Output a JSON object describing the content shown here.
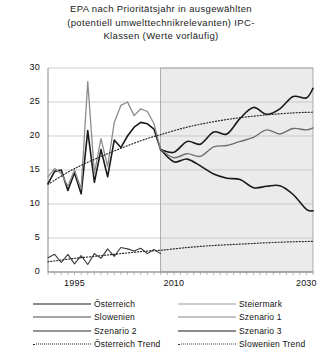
{
  "chart_data": {
    "type": "line",
    "title_lines": [
      "EPA nach Prioritätsjahr in ausgewählten",
      "(potentiell umwelttechnikrelevanten) IPC-",
      "Klassen (Werte vorläufig)"
    ],
    "xlabel": "",
    "ylabel": "",
    "xlim": [
      1991,
      2031
    ],
    "ylim": [
      0,
      30
    ],
    "yticks": [
      0,
      5,
      10,
      15,
      20,
      25,
      30
    ],
    "xticks": [
      1995,
      2010,
      2030
    ],
    "grid": true,
    "legend_position": "below",
    "forecast_region": {
      "start": 2008,
      "end": 2031,
      "shaded": true,
      "fill": "#ebebeb"
    },
    "series": [
      {
        "name": "Österreich",
        "style": "solid",
        "color": "#1a1a1a",
        "width": 1.6,
        "x": [
          1991,
          1992,
          1993,
          1994,
          1995,
          1996,
          1997,
          1998,
          1999,
          2000,
          2001,
          2002,
          2003,
          2004,
          2005,
          2006,
          2007,
          2008
        ],
        "values": [
          13.0,
          14.8,
          15.0,
          12.0,
          14.6,
          11.5,
          20.8,
          13.2,
          18.0,
          14.0,
          19.4,
          18.3,
          20.0,
          21.3,
          22.0,
          21.8,
          21.0,
          18.0
        ]
      },
      {
        "name": "Steiermark",
        "style": "solid",
        "color": "#8c8c8c",
        "width": 1.3,
        "x": [
          1991,
          1992,
          1993,
          1994,
          1995,
          1996,
          1997,
          1998,
          1999,
          2000,
          2001,
          2002,
          2003,
          2004,
          2005,
          2006,
          2007,
          2008
        ],
        "values": [
          14.0,
          15.2,
          14.5,
          12.6,
          15.0,
          12.2,
          28.0,
          14.5,
          19.6,
          15.5,
          22.0,
          24.5,
          25.0,
          23.0,
          24.0,
          23.6,
          21.8,
          18.0
        ]
      },
      {
        "name": "Slowenien",
        "style": "solid",
        "color": "#3a3a3a",
        "width": 1.1,
        "x": [
          1991,
          1992,
          1993,
          1994,
          1995,
          1996,
          1997,
          1998,
          1999,
          2000,
          2001,
          2002,
          2003,
          2004,
          2005,
          2006,
          2007,
          2008
        ],
        "values": [
          2.1,
          2.6,
          1.4,
          2.6,
          1.2,
          2.4,
          1.1,
          2.7,
          2.0,
          3.4,
          2.3,
          3.6,
          3.4,
          3.1,
          3.5,
          2.7,
          3.3,
          2.7
        ]
      },
      {
        "name": "Szenario 1",
        "style": "solid",
        "color": "#1a1a1a",
        "width": 1.6,
        "x": [
          2008,
          2010,
          2012,
          2014,
          2016,
          2018,
          2020,
          2022,
          2024,
          2026,
          2028,
          2030,
          2031
        ],
        "values": [
          18.0,
          17.6,
          19.2,
          18.8,
          20.6,
          20.3,
          22.6,
          24.2,
          23.2,
          24.0,
          25.8,
          25.6,
          27.0
        ]
      },
      {
        "name": "Szenario 2",
        "style": "solid",
        "color": "#1a1a1a",
        "width": 1.6,
        "x": [
          2008,
          2010,
          2012,
          2014,
          2016,
          2018,
          2020,
          2022,
          2024,
          2026,
          2028,
          2030,
          2031
        ],
        "values": [
          18.0,
          16.2,
          16.6,
          15.6,
          14.4,
          13.8,
          13.6,
          12.4,
          12.6,
          12.7,
          11.4,
          9.2,
          9.0
        ]
      },
      {
        "name": "Szenario 3",
        "style": "solid",
        "color": "#6e6e6e",
        "width": 1.4,
        "x": [
          2008,
          2010,
          2012,
          2014,
          2016,
          2018,
          2020,
          2022,
          2024,
          2026,
          2028,
          2030,
          2031
        ],
        "values": [
          18.0,
          16.8,
          17.4,
          17.0,
          18.4,
          18.6,
          19.2,
          19.8,
          20.9,
          20.3,
          21.1,
          20.9,
          21.2
        ]
      },
      {
        "name": "Österreich Trend",
        "style": "dotted",
        "color": "#2b2b2b",
        "width": 1.2,
        "x": [
          1991,
          1995,
          2000,
          2005,
          2008,
          2012,
          2016,
          2020,
          2024,
          2028,
          2031
        ],
        "values": [
          12.9,
          15.2,
          17.4,
          19.3,
          20.2,
          21.3,
          22.1,
          22.7,
          23.1,
          23.4,
          23.5
        ]
      },
      {
        "name": "Slowenien Trend",
        "style": "dotted",
        "color": "#2b2b2b",
        "width": 1.2,
        "x": [
          1991,
          1995,
          2000,
          2005,
          2008,
          2012,
          2016,
          2020,
          2024,
          2028,
          2031
        ],
        "values": [
          1.5,
          2.0,
          2.5,
          3.0,
          3.2,
          3.6,
          3.9,
          4.1,
          4.3,
          4.45,
          4.5
        ]
      }
    ],
    "legend": [
      {
        "label": "Österreich",
        "style": "solid",
        "color": "#1a1a1a",
        "width": 1.8,
        "column": "left"
      },
      {
        "label": "Steiermark",
        "style": "solid",
        "color": "#9a9a9a",
        "width": 1.2,
        "column": "right"
      },
      {
        "label": "Slowenien",
        "style": "solid",
        "color": "#4a4a4a",
        "width": 1.1,
        "column": "left"
      },
      {
        "label": "Szenario 1",
        "style": "solid",
        "color": "#8a8a8a",
        "width": 1.1,
        "column": "right"
      },
      {
        "label": "Szenario 2",
        "style": "solid",
        "color": "#2b2b2b",
        "width": 1.6,
        "column": "left"
      },
      {
        "label": "Szenario 3",
        "style": "solid",
        "color": "#1a1a1a",
        "width": 1.8,
        "column": "right"
      },
      {
        "label": "Österreich Trend",
        "style": "dotted",
        "color": "#1a1a1a",
        "width": 1.8,
        "column": "left"
      },
      {
        "label": "Slowenien Trend",
        "style": "dotted",
        "color": "#3a3a3a",
        "width": 1.4,
        "column": "right"
      }
    ]
  }
}
